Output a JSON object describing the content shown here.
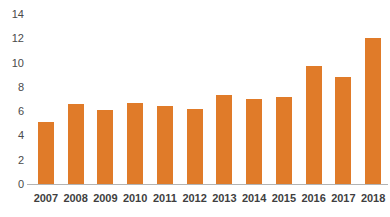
{
  "chart_data": {
    "type": "bar",
    "title": "",
    "xlabel": "",
    "ylabel": "",
    "categories": [
      "2007",
      "2008",
      "2009",
      "2010",
      "2011",
      "2012",
      "2013",
      "2014",
      "2015",
      "2016",
      "2017",
      "2018"
    ],
    "values": [
      5.1,
      6.6,
      6.1,
      6.7,
      6.4,
      6.2,
      7.3,
      7.0,
      7.2,
      9.7,
      8.8,
      12.0
    ],
    "ylim": [
      0,
      14
    ],
    "yticks": [
      0,
      2,
      4,
      6,
      8,
      10,
      12,
      14
    ],
    "ytick_labels": [
      "0",
      "2",
      "4",
      "6",
      "8",
      "10",
      "12",
      "14"
    ],
    "grid": false,
    "legend": false,
    "bar_color": "#E07B29",
    "axis_color": "#b3b3b3",
    "label_color": "#3f3f3f"
  }
}
